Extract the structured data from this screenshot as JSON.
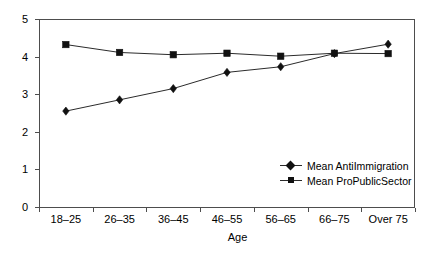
{
  "chart_data": {
    "type": "line",
    "title": "",
    "subtitle": "",
    "xlabel": "Age",
    "ylabel": "",
    "categories": [
      "18–25",
      "26–35",
      "36–45",
      "46–55",
      "56–65",
      "66–75",
      "Over 75"
    ],
    "ylim": [
      0,
      5
    ],
    "yticks": [
      "0",
      "1",
      "2",
      "3",
      "4",
      "5"
    ],
    "grid": false,
    "legend_position": "inside lower-right",
    "series": [
      {
        "name": "Mean AntiImmigration",
        "marker": "diamond",
        "color": "#111111",
        "values": [
          2.55,
          2.85,
          3.15,
          3.58,
          3.73,
          4.08,
          4.33
        ]
      },
      {
        "name": "Mean ProPublicSector",
        "marker": "square",
        "color": "#111111",
        "values": [
          4.32,
          4.11,
          4.05,
          4.09,
          4.01,
          4.09,
          4.08
        ]
      }
    ]
  },
  "legend": {
    "entries": [
      {
        "label": "Mean AntiImmigration",
        "icon": "diamond-marker-icon"
      },
      {
        "label": "Mean ProPublicSector",
        "icon": "square-marker-icon"
      }
    ]
  },
  "axes": {
    "x_title": "Age"
  }
}
